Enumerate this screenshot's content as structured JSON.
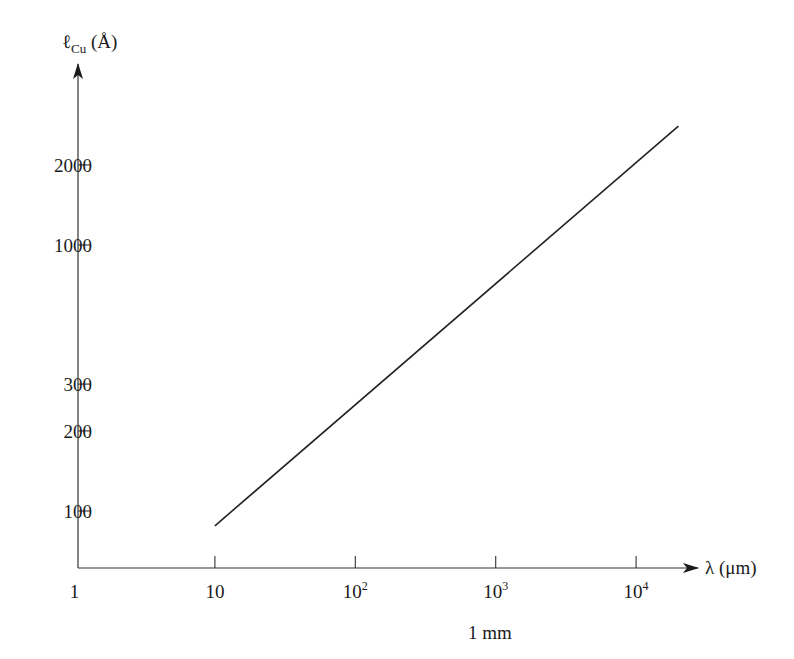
{
  "chart_data": {
    "type": "line",
    "title": "",
    "xscale": "log",
    "yscale": "log",
    "xlabel": "λ (μm)",
    "ylabel": "ℓCu (Å)",
    "ylabel_parts": {
      "symbol": "ℓ",
      "subscript": "Cu",
      "unit": "(Å)"
    },
    "xlabel_parts": {
      "symbol": "λ",
      "unit": "(μm)"
    },
    "x_tick_labels": [
      {
        "value": 1,
        "base": "1",
        "exp": ""
      },
      {
        "value": 10,
        "base": "10",
        "exp": ""
      },
      {
        "value": 100,
        "base": "10",
        "exp": "2"
      },
      {
        "value": 1000,
        "base": "10",
        "exp": "3"
      },
      {
        "value": 10000,
        "base": "10",
        "exp": "4"
      }
    ],
    "y_tick_labels": [
      "100",
      "200",
      "300",
      "1000",
      "2000"
    ],
    "y_tick_values": [
      100,
      200,
      300,
      1000,
      2000
    ],
    "annotation": "1 mm",
    "annotation_x": 1000,
    "xlim": [
      1,
      25000
    ],
    "ylim": [
      60,
      4000
    ],
    "grid": false,
    "legend": null,
    "series": [
      {
        "name": "ℓCu vs λ",
        "x": [
          10,
          20000
        ],
        "y": [
          88,
          2800
        ]
      }
    ]
  },
  "labels": {
    "annotation": "1 mm",
    "origin": "1"
  }
}
